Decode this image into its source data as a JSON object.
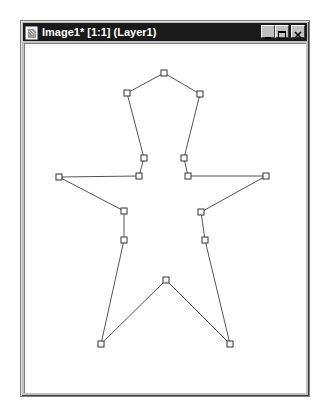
{
  "window": {
    "title": "Image1* [1:1] (Layer1)",
    "buttons": {
      "minimize": "minimize",
      "maximize": "maximize",
      "close": "close"
    }
  },
  "shape": {
    "stroke": "#555555",
    "handle_fill": "#ffffff",
    "handle_stroke": "#333333",
    "vertices": [
      {
        "name": "head-top",
        "x": 164,
        "y": 73
      },
      {
        "name": "head-right",
        "x": 200,
        "y": 94
      },
      {
        "name": "neck-right",
        "x": 184,
        "y": 158
      },
      {
        "name": "shoulder-right",
        "x": 188,
        "y": 176
      },
      {
        "name": "hand-right",
        "x": 266,
        "y": 176
      },
      {
        "name": "armpit-right",
        "x": 201,
        "y": 212
      },
      {
        "name": "hip-right",
        "x": 205,
        "y": 240
      },
      {
        "name": "foot-right",
        "x": 230,
        "y": 344
      },
      {
        "name": "crotch",
        "x": 166,
        "y": 280
      },
      {
        "name": "foot-left",
        "x": 101,
        "y": 344
      },
      {
        "name": "hip-left",
        "x": 124,
        "y": 240
      },
      {
        "name": "armpit-left",
        "x": 124,
        "y": 211
      },
      {
        "name": "hand-left",
        "x": 59,
        "y": 177
      },
      {
        "name": "shoulder-left",
        "x": 139,
        "y": 176
      },
      {
        "name": "neck-left",
        "x": 144,
        "y": 158
      },
      {
        "name": "head-left",
        "x": 127,
        "y": 93
      }
    ]
  }
}
